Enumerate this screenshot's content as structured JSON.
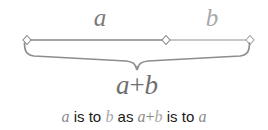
{
  "figure": {
    "title_semantic": "golden-ratio-segment-diagram",
    "background_color": "#ffffff",
    "line": {
      "start_x": 27,
      "mid_x": 166,
      "end_x": 250,
      "y": 40,
      "segment_a_color": "#848484",
      "segment_b_color": "#b4b4b4",
      "marker_shape": "diamond",
      "marker_count": 3
    },
    "brace": {
      "left_x": 24,
      "right_x": 252,
      "tip_x": 137,
      "top_y": 42,
      "bottom_y": 70,
      "color": "#8d8d8d"
    }
  },
  "labels": {
    "segment_a": "a",
    "segment_b": "b",
    "sum_left": "a",
    "sum_operator": "+",
    "sum_right": "b",
    "sum_full": "a+b"
  },
  "caption": {
    "var_a_first": "a",
    "is_to_first": "is to",
    "var_b": "b",
    "as": "as",
    "sum_a": "a",
    "sum_plus": "+",
    "sum_b": "b",
    "is_to_second": "is to",
    "var_a_last": "a",
    "full_text": "a is to b as a+b is to a"
  },
  "colors": {
    "math_gray": "#8a8a8a",
    "math_gray_light": "#a9a9a9",
    "text_black": "#1a1a1a",
    "line_dark": "#848484",
    "line_light": "#b4b4b4",
    "brace": "#8d8d8d"
  }
}
